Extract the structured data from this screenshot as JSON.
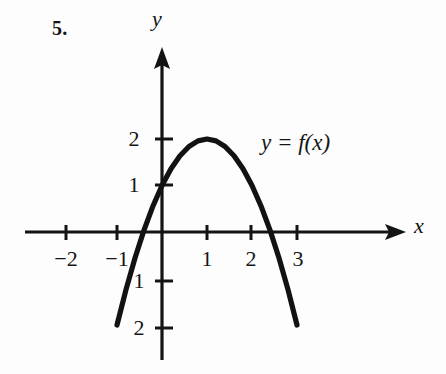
{
  "figure": {
    "problem_number": "5.",
    "function_label": "y = f(x)",
    "x_axis_label": "x",
    "y_axis_label": "y",
    "ink_color": "#141414",
    "background_color": "#fdfdfd"
  },
  "chart_data": {
    "type": "line",
    "title": "",
    "subtitle": "",
    "xlabel": "x",
    "ylabel": "y",
    "legend": [
      "y = f(x)"
    ],
    "legend_position": "inside-upper-right",
    "grid": false,
    "xlim": [
      -2.6,
      3.6
    ],
    "ylim": [
      -2.6,
      2.6
    ],
    "xticks": [
      -2,
      -1,
      1,
      2,
      3
    ],
    "xtick_labels": [
      "−2",
      "−1",
      "1",
      "2",
      "3"
    ],
    "yticks": [
      -2,
      -1,
      1,
      2
    ],
    "ytick_labels": [
      "2",
      "1",
      "1",
      "2"
    ],
    "ytick_labels_display": [
      "2",
      "1",
      "−1",
      "−2"
    ],
    "equation": "y = -x^2 + 2x + 1",
    "vertex": [
      1,
      2
    ],
    "y_intercept": [
      0,
      1
    ],
    "x_domain_drawn": [
      -1,
      3
    ],
    "endpoints": [
      [
        -1,
        -2
      ],
      [
        3,
        -2
      ]
    ],
    "x": [
      -1,
      -0.8,
      -0.6,
      -0.4,
      -0.2,
      0,
      0.2,
      0.4,
      0.6,
      0.8,
      1,
      1.2,
      1.4,
      1.6,
      1.8,
      2,
      2.2,
      2.4,
      2.6,
      2.8,
      3
    ],
    "y": [
      -2,
      -1.24,
      -0.56,
      0.04,
      0.56,
      1,
      1.36,
      1.64,
      1.84,
      1.96,
      2,
      1.96,
      1.84,
      1.64,
      1.36,
      1,
      0.56,
      0.04,
      -0.56,
      -1.24,
      -2
    ]
  },
  "ticks": {
    "x_negative": [
      {
        "label": "−2",
        "value": -2,
        "px": 66
      },
      {
        "label": "−1",
        "value": -1,
        "px": 117
      }
    ],
    "x_positive": [
      {
        "label": "1",
        "value": 1,
        "px": 207
      },
      {
        "label": "2",
        "value": 2,
        "px": 251
      },
      {
        "label": "3",
        "value": 3,
        "px": 297
      }
    ],
    "y_positive": [
      {
        "label": "2",
        "value": 2,
        "px": 139
      },
      {
        "label": "1",
        "value": 1,
        "px": 185
      }
    ],
    "y_negative": [
      {
        "label": "1",
        "value": -1,
        "px": 281
      },
      {
        "label": "2",
        "value": -2,
        "px": 328
      }
    ]
  }
}
